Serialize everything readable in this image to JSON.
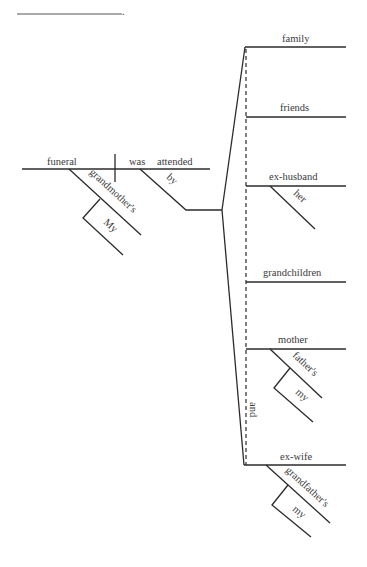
{
  "sentence_blank": {
    "terminal_punctuation": "."
  },
  "main_clause": {
    "subject": "funeral",
    "verb_helper": "was",
    "verb": "attended",
    "subject_modifiers": [
      {
        "word": "grandmother's",
        "modifiers": [
          {
            "word": "My"
          }
        ]
      }
    ],
    "verb_modifiers": [
      {
        "preposition": "by"
      }
    ]
  },
  "compound_objects": {
    "conjunction": "and",
    "items": [
      {
        "word": "family",
        "modifiers": []
      },
      {
        "word": "friends",
        "modifiers": []
      },
      {
        "word": "ex-husband",
        "modifiers": [
          {
            "word": "her"
          }
        ]
      },
      {
        "word": "grandchildren",
        "modifiers": []
      },
      {
        "word": "mother",
        "modifiers": [
          {
            "word": "father's",
            "modifiers": [
              {
                "word": "my"
              }
            ]
          }
        ]
      },
      {
        "word": "ex-wife",
        "modifiers": [
          {
            "word": "grandfather's",
            "modifiers": [
              {
                "word": "my"
              }
            ]
          }
        ]
      }
    ]
  }
}
